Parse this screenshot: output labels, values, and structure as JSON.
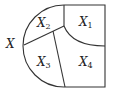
{
  "diagram": {
    "type": "region-partition",
    "stroke_color": "#333333",
    "outer_label": "X",
    "regions": [
      {
        "id": "X1",
        "letter": "X",
        "sub": "1"
      },
      {
        "id": "X2",
        "letter": "X",
        "sub": "2"
      },
      {
        "id": "X3",
        "letter": "X",
        "sub": "3"
      },
      {
        "id": "X4",
        "letter": "X",
        "sub": "4"
      }
    ]
  }
}
